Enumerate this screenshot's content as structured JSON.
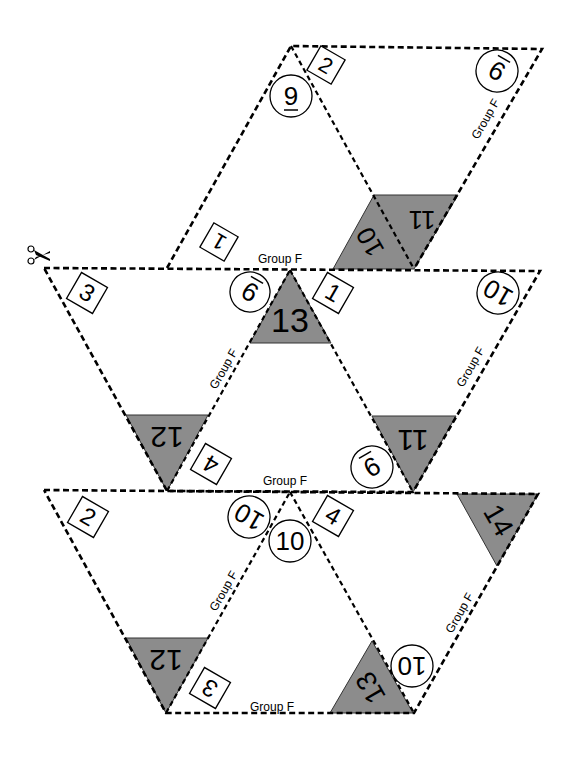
{
  "title": "Group F",
  "group_label": "Group F",
  "scissors_icon": "scissors-icon",
  "colors": {
    "gray_face": "#8c8c8c",
    "line": "#000000",
    "background": "#ffffff"
  },
  "top_piece": {
    "square_labels": [
      "1",
      "2"
    ],
    "circle_labels": [
      "9",
      "9"
    ],
    "gray_labels": [
      "10",
      "11"
    ]
  },
  "middle_piece": {
    "square_labels": [
      "3",
      "1",
      "4"
    ],
    "circle_labels": [
      "9",
      "10",
      "9"
    ],
    "gray_labels": [
      "13",
      "12",
      "11"
    ]
  },
  "bottom_piece": {
    "square_labels": [
      "2",
      "4",
      "3"
    ],
    "circle_labels": [
      "10",
      "10",
      "10"
    ],
    "gray_labels": [
      "14",
      "12",
      "13"
    ]
  }
}
